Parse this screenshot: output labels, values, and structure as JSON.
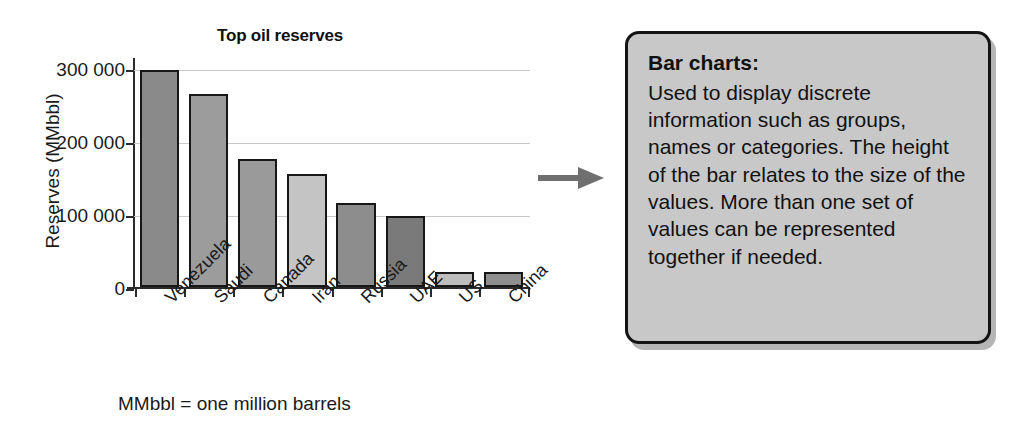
{
  "figure": {
    "footnote": "MMbbl = one million barrels",
    "arrow_icon": "arrow-right-icon"
  },
  "callout": {
    "heading": "Bar charts:",
    "body": "Used to display discrete information such as groups, names or categories. The height of the bar relates to the size of the values. More than one set of values can be represented together if needed."
  },
  "chart_data": {
    "type": "bar",
    "title": "Top oil reserves",
    "xlabel": "",
    "ylabel": "Reserves (MMbbl)",
    "categories": [
      "Venezuela",
      "Saudi",
      "Canada",
      "Iran",
      "Russia",
      "UAE",
      "US",
      "China"
    ],
    "values": [
      297000,
      265000,
      175000,
      155000,
      115000,
      98000,
      20000,
      20000
    ],
    "tick_labels": [
      "0",
      "100 000",
      "200 000",
      "300 000"
    ],
    "ticks": [
      0,
      100000,
      200000,
      300000
    ],
    "ylim": [
      0,
      310000
    ],
    "grid": true,
    "legend": "none",
    "bar_colors": [
      "#8a8a8a",
      "#9c9c9c",
      "#9a9a9a",
      "#c4c4c4",
      "#8d8d8d",
      "#7a7a7a",
      "#bdbdbd",
      "#8f8f8f"
    ],
    "bar_edge_color": "#171717",
    "grid_color": "#c9c9c9",
    "axis_color": "#2b2b2b"
  }
}
